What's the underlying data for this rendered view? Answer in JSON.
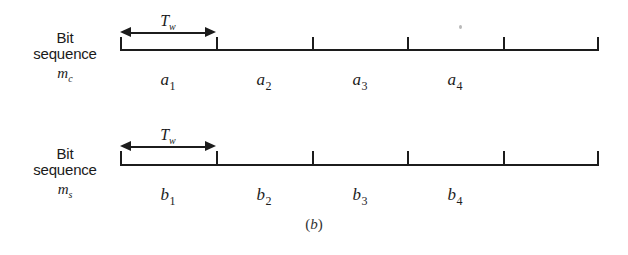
{
  "figure": {
    "caption": "(b)",
    "caption_open": "(",
    "caption_letter": "b",
    "caption_close": ")"
  },
  "rows": [
    {
      "id": "mc",
      "label_line1": "Bit",
      "label_line2": "sequence",
      "symbol_letter": "m",
      "symbol_subscript": "c",
      "duration_label_letter": "T",
      "duration_label_subscript": "w",
      "slots": [
        {
          "letter": "a",
          "index": "1"
        },
        {
          "letter": "a",
          "index": "2"
        },
        {
          "letter": "a",
          "index": "3"
        },
        {
          "letter": "a",
          "index": "4"
        }
      ]
    },
    {
      "id": "ms",
      "label_line1": "Bit",
      "label_line2": "sequence",
      "symbol_letter": "m",
      "symbol_subscript": "s",
      "duration_label_letter": "T",
      "duration_label_subscript": "w",
      "slots": [
        {
          "letter": "b",
          "index": "1"
        },
        {
          "letter": "b",
          "index": "2"
        },
        {
          "letter": "b",
          "index": "3"
        },
        {
          "letter": "b",
          "index": "4"
        }
      ]
    }
  ],
  "style": {
    "ink": "#1c1c1c",
    "background": "#ffffff"
  }
}
